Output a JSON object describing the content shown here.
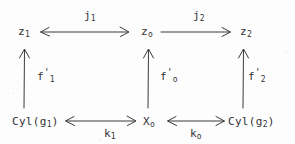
{
  "diagram": {
    "kind": "commutative-diagram",
    "background_color": "#fdfdfd",
    "ink_color": "#333333",
    "nodes": [
      {
        "id": "z1",
        "label": "z",
        "sub": "1",
        "x": 18,
        "y": 28
      },
      {
        "id": "z0",
        "label": "z",
        "sub": "o",
        "x": 141,
        "y": 28
      },
      {
        "id": "z2",
        "label": "z",
        "sub": "2",
        "x": 240,
        "y": 28
      },
      {
        "id": "cylg1",
        "label": "Cyl(g",
        "sub": "1",
        "suffix": ")",
        "x": 12,
        "y": 118
      },
      {
        "id": "x0",
        "label": "X",
        "sub": "o",
        "x": 143,
        "y": 118
      },
      {
        "id": "cylg2",
        "label": "Cyl(g",
        "sub": "2",
        "suffix": ")",
        "x": 228,
        "y": 118
      }
    ],
    "edges": [
      {
        "id": "j1",
        "label": "j",
        "sub": "1",
        "prime": "",
        "from": "z1",
        "to": "z0",
        "direction": "both",
        "orientation": "horizontal",
        "label_x": 84,
        "label_y": 10
      },
      {
        "id": "j2",
        "label": "j",
        "sub": "2",
        "prime": "",
        "from": "z0",
        "to": "z2",
        "direction": "right",
        "orientation": "horizontal",
        "label_x": 193,
        "label_y": 10
      },
      {
        "id": "f1p",
        "label": "f",
        "sub": "1",
        "prime": "'",
        "from": "cylg1",
        "to": "z1",
        "direction": "up",
        "orientation": "vertical",
        "label_x": 37,
        "label_y": 68
      },
      {
        "id": "f0p",
        "label": "f",
        "sub": "o",
        "prime": "'",
        "from": "x0",
        "to": "z0",
        "direction": "up",
        "orientation": "vertical",
        "label_x": 160,
        "label_y": 68
      },
      {
        "id": "f2p",
        "label": "f",
        "sub": "2",
        "prime": "'",
        "from": "cylg2",
        "to": "z2",
        "direction": "up",
        "orientation": "vertical",
        "label_x": 248,
        "label_y": 68
      },
      {
        "id": "k1",
        "label": "k",
        "sub": "1",
        "prime": "",
        "from": "cylg1",
        "to": "x0",
        "direction": "both",
        "orientation": "horizontal",
        "label_x": 104,
        "label_y": 128
      },
      {
        "id": "k0",
        "label": "k",
        "sub": "o",
        "prime": "",
        "from": "x0",
        "to": "cylg2",
        "direction": "both",
        "orientation": "horizontal",
        "label_x": 190,
        "label_y": 128
      }
    ]
  }
}
